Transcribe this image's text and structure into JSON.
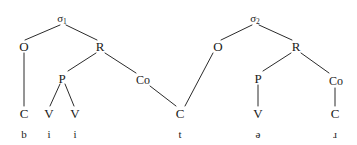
{
  "diagram": {
    "width": 357,
    "height": 145,
    "background": "#ffffff",
    "line_color": "#2b2b2b",
    "text_color": "#1a1a1a",
    "nodes": {
      "sigma1": "σ",
      "sigma1_sub": "1",
      "sigma2": "σ",
      "sigma2_sub": "2",
      "onset1": "O",
      "rhyme1": "R",
      "peak1": "P",
      "coda1": "Co",
      "onset2": "O",
      "rhyme2": "R",
      "peak2": "P",
      "coda2": "Co",
      "seg_c1": "C",
      "seg_v1": "V",
      "seg_v2": "V",
      "seg_c_shared": "C",
      "seg_v3": "V",
      "seg_c2": "C"
    },
    "phonemes": {
      "p1": "b",
      "p2": "i",
      "p3": "i",
      "p4": "t",
      "p5": "ə",
      "p6": "ɹ"
    }
  }
}
